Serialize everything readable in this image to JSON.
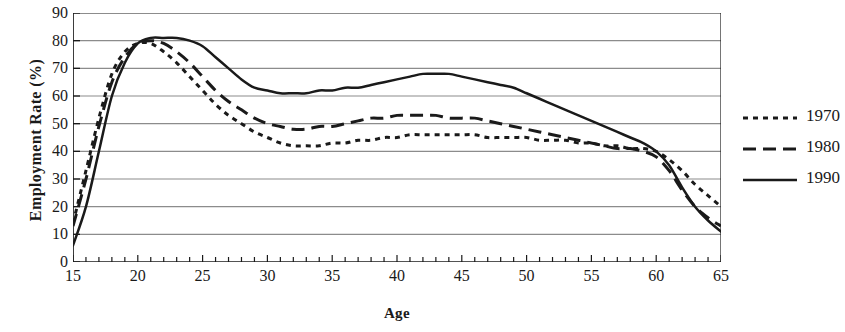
{
  "chart_data": {
    "type": "line",
    "title": "",
    "xlabel": "Age",
    "ylabel": "Employment Rate (%)",
    "xlim": [
      15,
      65
    ],
    "ylim": [
      0,
      90
    ],
    "grid": true,
    "legend_position": "right",
    "y_ticks": [
      90,
      80,
      70,
      60,
      50,
      40,
      30,
      20,
      10,
      0
    ],
    "x_ticks": [
      15,
      20,
      25,
      30,
      35,
      40,
      45,
      50,
      55,
      60,
      65
    ],
    "x_tick_step_minor": 1,
    "x": [
      15,
      16,
      17,
      18,
      19,
      20,
      21,
      22,
      23,
      24,
      25,
      26,
      27,
      28,
      29,
      30,
      31,
      32,
      33,
      34,
      35,
      36,
      37,
      38,
      39,
      40,
      41,
      42,
      43,
      44,
      45,
      46,
      47,
      48,
      49,
      50,
      51,
      52,
      53,
      54,
      55,
      56,
      57,
      58,
      59,
      60,
      61,
      62,
      63,
      64,
      65
    ],
    "series": [
      {
        "name": "1970",
        "style": "dotted",
        "color": "#1a1a1a",
        "values": [
          14,
          33,
          52,
          68,
          76,
          79,
          79,
          76,
          72,
          67,
          62,
          57,
          53,
          50,
          47,
          45,
          43,
          42,
          42,
          42,
          43,
          43,
          44,
          44,
          45,
          45,
          46,
          46,
          46,
          46,
          46,
          46,
          45,
          45,
          45,
          45,
          44,
          44,
          44,
          43,
          43,
          42,
          42,
          41,
          41,
          40,
          37,
          33,
          28,
          24,
          20
        ]
      },
      {
        "name": "1980",
        "style": "dashed",
        "color": "#1a1a1a",
        "values": [
          13,
          30,
          49,
          65,
          74,
          79,
          80,
          79,
          76,
          72,
          67,
          62,
          58,
          55,
          52,
          50,
          49,
          48,
          48,
          49,
          49,
          50,
          51,
          52,
          52,
          53,
          53,
          53,
          53,
          52,
          52,
          52,
          51,
          50,
          49,
          48,
          47,
          46,
          45,
          44,
          43,
          42,
          41,
          41,
          40,
          38,
          33,
          26,
          20,
          16,
          13
        ]
      },
      {
        "name": "1990",
        "style": "solid",
        "color": "#1a1a1a",
        "values": [
          6,
          20,
          40,
          60,
          72,
          79,
          81,
          81,
          81,
          80,
          78,
          74,
          70,
          66,
          63,
          62,
          61,
          61,
          61,
          62,
          62,
          63,
          63,
          64,
          65,
          66,
          67,
          68,
          68,
          68,
          67,
          66,
          65,
          64,
          63,
          61,
          59,
          57,
          55,
          53,
          51,
          49,
          47,
          45,
          43,
          40,
          35,
          27,
          20,
          15,
          11
        ]
      }
    ]
  },
  "legend": {
    "items": [
      {
        "label": "1970"
      },
      {
        "label": "1980"
      },
      {
        "label": "1990"
      }
    ]
  }
}
